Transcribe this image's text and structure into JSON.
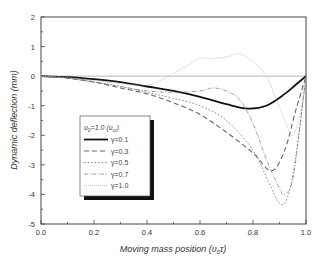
{
  "chart_data": {
    "type": "line",
    "title": "",
    "xlabel": "Moving mass position (υ0τ)",
    "ylabel": "Dynamic deflection (mm)",
    "xlim": [
      0.0,
      1.0
    ],
    "ylim": [
      -5,
      2
    ],
    "xticks": [
      "0.0",
      "0.2",
      "0.4",
      "0.6",
      "0.8",
      "1.0"
    ],
    "yticks": [
      "2",
      "1",
      "0",
      "-1",
      "-2",
      "-3",
      "-4",
      "-5"
    ],
    "grid": false,
    "legend_position": "lower-left (inside)",
    "legend_title": "υ0=1.0 (υcr)",
    "series": [
      {
        "name": "γ=0.1",
        "style": "thick-solid",
        "x": [
          0,
          0.1,
          0.2,
          0.3,
          0.4,
          0.5,
          0.6,
          0.7,
          0.78,
          0.85,
          0.92,
          0.96,
          1.0
        ],
        "values": [
          0,
          -0.03,
          -0.1,
          -0.2,
          -0.35,
          -0.5,
          -0.7,
          -0.95,
          -1.1,
          -1.0,
          -0.6,
          -0.3,
          0
        ]
      },
      {
        "name": "γ=0.3",
        "style": "dashed",
        "x": [
          0,
          0.1,
          0.2,
          0.3,
          0.4,
          0.5,
          0.6,
          0.7,
          0.8,
          0.87,
          0.92,
          0.96,
          1.0
        ],
        "values": [
          0,
          -0.07,
          -0.2,
          -0.4,
          -0.6,
          -0.9,
          -1.3,
          -1.9,
          -2.6,
          -3.2,
          -2.5,
          -1.2,
          0
        ]
      },
      {
        "name": "γ=0.5",
        "style": "dotted",
        "x": [
          0,
          0.1,
          0.2,
          0.3,
          0.4,
          0.5,
          0.6,
          0.7,
          0.8,
          0.86,
          0.9,
          0.93,
          0.96,
          1.0
        ],
        "values": [
          0,
          -0.07,
          -0.2,
          -0.35,
          -0.55,
          -0.75,
          -1.0,
          -1.5,
          -2.5,
          -3.6,
          -4.3,
          -4.1,
          -2.8,
          0
        ]
      },
      {
        "name": "γ=0.7",
        "style": "dash-dot",
        "x": [
          0,
          0.1,
          0.2,
          0.3,
          0.4,
          0.5,
          0.6,
          0.65,
          0.7,
          0.75,
          0.8,
          0.85,
          0.9,
          0.92,
          0.95,
          0.98,
          1.0
        ],
        "values": [
          0,
          -0.06,
          -0.2,
          -0.35,
          -0.5,
          -0.55,
          -0.5,
          -0.4,
          -0.5,
          -0.8,
          -1.6,
          -2.8,
          -3.8,
          -4.0,
          -3.5,
          -1.5,
          0
        ]
      },
      {
        "name": "γ=1.0",
        "style": "thin-dotted",
        "x": [
          0,
          0.1,
          0.2,
          0.3,
          0.4,
          0.45,
          0.5,
          0.55,
          0.6,
          0.65,
          0.7,
          0.75,
          0.8,
          0.85,
          0.88,
          0.92,
          0.95,
          0.98,
          1.0
        ],
        "values": [
          0,
          -0.05,
          -0.15,
          -0.25,
          -0.3,
          -0.15,
          0.1,
          0.35,
          0.6,
          0.6,
          0.65,
          0.75,
          0.5,
          0.0,
          -0.6,
          -1.5,
          -2.0,
          -1.2,
          0
        ]
      }
    ]
  },
  "axes": {
    "xlabel_main": "Moving mass position (υ",
    "xlabel_sub": "0",
    "xlabel_end": "τ)",
    "ylabel": "Dynamic  deflection (mm)"
  },
  "legend": {
    "title_main": "υ",
    "title_sub": "0",
    "title_rest": "=1.0 (υ",
    "title_sub2": "cr",
    "title_end": ")",
    "items": [
      "γ=0.1",
      "γ=0.3",
      "γ=0.5",
      "γ=0.7",
      "γ=1.0"
    ]
  }
}
